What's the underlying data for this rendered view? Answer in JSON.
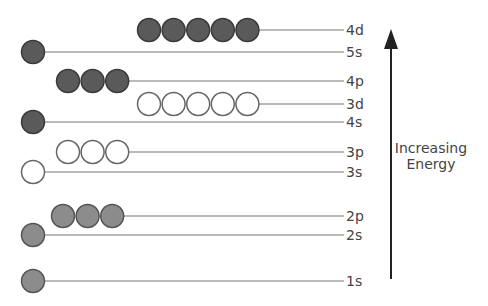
{
  "diagram": {
    "arrow": {
      "label_line1": "Increasing",
      "label_line2": "Energy",
      "direction": "up"
    },
    "colors": {
      "dark_fill": "#5a5a5a",
      "dark_stroke": "#3a3a3a",
      "light_fill": "#8c8c8c",
      "light_stroke": "#555555",
      "empty_fill": "#ffffff",
      "empty_stroke": "#666666",
      "line": "#777777",
      "text": "#444444"
    },
    "levels": [
      {
        "label": "4d",
        "y": 30,
        "count": 5,
        "start_x": 149,
        "fill": "dark"
      },
      {
        "label": "5s",
        "y": 52,
        "count": 1,
        "start_x": 33,
        "fill": "dark"
      },
      {
        "label": "4p",
        "y": 81,
        "count": 3,
        "start_x": 68,
        "fill": "dark"
      },
      {
        "label": "3d",
        "y": 104,
        "count": 5,
        "start_x": 149,
        "fill": "empty"
      },
      {
        "label": "4s",
        "y": 122,
        "count": 1,
        "start_x": 33,
        "fill": "dark"
      },
      {
        "label": "3p",
        "y": 152,
        "count": 3,
        "start_x": 68,
        "fill": "empty"
      },
      {
        "label": "3s",
        "y": 172,
        "count": 1,
        "start_x": 33,
        "fill": "empty"
      },
      {
        "label": "2p",
        "y": 216,
        "count": 3,
        "start_x": 63,
        "fill": "light"
      },
      {
        "label": "2s",
        "y": 235,
        "count": 1,
        "start_x": 33,
        "fill": "light"
      },
      {
        "label": "1s",
        "y": 281,
        "count": 1,
        "start_x": 33,
        "fill": "light"
      }
    ]
  }
}
